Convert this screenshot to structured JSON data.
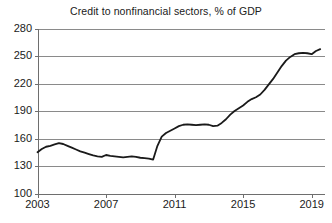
{
  "chart_data": {
    "type": "line",
    "title": "Credit to nonfinancial sectors, % of GDP",
    "xlabel": "",
    "ylabel": "",
    "ylim": [
      100,
      280
    ],
    "ytick_step": 30,
    "yticks": [
      100,
      130,
      160,
      190,
      220,
      250,
      280
    ],
    "xlim": [
      2003.0,
      2019.75
    ],
    "xticks": [
      2003,
      2007,
      2011,
      2015,
      2019
    ],
    "xtick_labels": [
      "2003",
      "2007",
      "2011",
      "2015",
      "2019"
    ],
    "grid": "horizontal",
    "legend": "none",
    "line_color": "#1a1a1a",
    "line_width": 1.8,
    "series": [
      {
        "name": "Credit to nonfinancial sectors",
        "x": [
          2003.0,
          2003.25,
          2003.5,
          2003.75,
          2004.0,
          2004.25,
          2004.5,
          2004.75,
          2005.0,
          2005.25,
          2005.5,
          2005.75,
          2006.0,
          2006.25,
          2006.5,
          2006.75,
          2007.0,
          2007.25,
          2007.5,
          2007.75,
          2008.0,
          2008.25,
          2008.5,
          2008.75,
          2009.0,
          2009.25,
          2009.5,
          2009.75,
          2010.0,
          2010.25,
          2010.5,
          2010.75,
          2011.0,
          2011.25,
          2011.5,
          2011.75,
          2012.0,
          2012.25,
          2012.5,
          2012.75,
          2013.0,
          2013.25,
          2013.5,
          2013.75,
          2014.0,
          2014.25,
          2014.5,
          2014.75,
          2015.0,
          2015.25,
          2015.5,
          2015.75,
          2016.0,
          2016.25,
          2016.5,
          2016.75,
          2017.0,
          2017.25,
          2017.5,
          2017.75,
          2018.0,
          2018.25,
          2018.5,
          2018.75,
          2019.0,
          2019.25,
          2019.5
        ],
        "values": [
          145.0,
          148.5,
          151.0,
          152.0,
          153.5,
          155.0,
          154.0,
          152.0,
          150.0,
          148.0,
          146.0,
          144.5,
          143.0,
          141.5,
          140.5,
          140.0,
          142.0,
          141.0,
          140.5,
          140.0,
          139.5,
          140.0,
          140.5,
          140.0,
          139.0,
          138.5,
          138.0,
          137.0,
          152.0,
          162.0,
          166.0,
          168.5,
          171.0,
          173.5,
          175.0,
          175.5,
          175.0,
          174.5,
          175.0,
          175.5,
          175.0,
          173.5,
          174.0,
          177.0,
          181.0,
          186.0,
          190.0,
          193.0,
          196.0,
          200.0,
          203.0,
          205.0,
          208.0,
          213.0,
          219.0,
          225.0,
          232.0,
          239.0,
          245.0,
          249.0,
          252.0,
          253.0,
          253.5,
          253.0,
          252.0,
          255.5,
          257.5
        ]
      }
    ]
  },
  "axes": {
    "y_labels": [
      "280",
      "250",
      "220",
      "190",
      "160",
      "130",
      "100"
    ],
    "x_labels": [
      "2003",
      "2007",
      "2011",
      "2015",
      "2019"
    ]
  },
  "colors": {
    "line": "#1a1a1a",
    "grid": "#8a8a8a",
    "axis": "#6e6e6e",
    "background": "#ffffff",
    "text": "#1a1a1a"
  }
}
